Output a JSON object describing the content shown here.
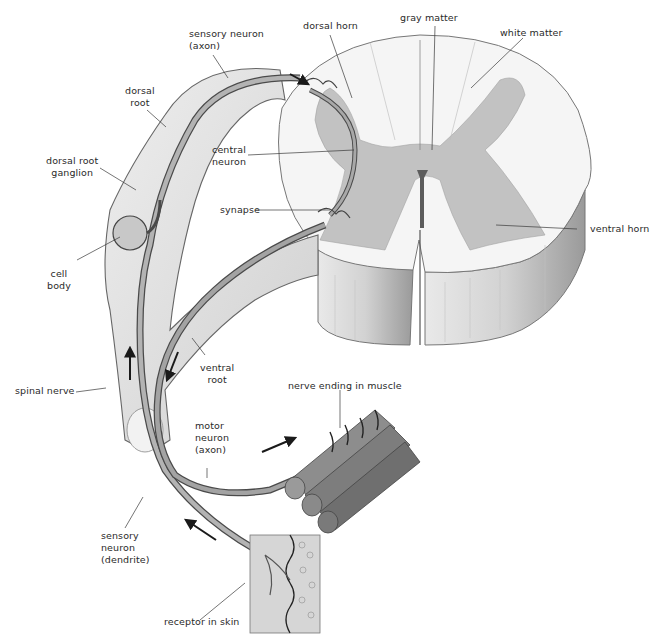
{
  "diagram": {
    "colors": {
      "nerve": "#a9a9a9",
      "nerve_dark": "#5a5a5a",
      "gray_matter": "#b7b7b7",
      "white_matter": "#f3f3f3",
      "outline": "#6a6a6a",
      "text": "#2a2a2a"
    },
    "labels": {
      "sensory_axon": [
        "sensory neuron",
        "(axon)"
      ],
      "dorsal_horn": "dorsal horn",
      "gray_matter": "gray matter",
      "white_matter": "white matter",
      "dorsal_root": [
        "dorsal",
        "root"
      ],
      "dorsal_root_ganglion": [
        "dorsal root",
        "ganglion"
      ],
      "central_neuron": [
        "central",
        "neuron"
      ],
      "synapse": "synapse",
      "cell_body": [
        "cell",
        "body"
      ],
      "ventral_horn": "ventral horn",
      "spinal_nerve": "spinal nerve",
      "ventral_root": [
        "ventral",
        "root"
      ],
      "nerve_ending_muscle": "nerve ending in muscle",
      "motor_axon": [
        "motor",
        "neuron",
        "(axon)"
      ],
      "sensory_dendrite": [
        "sensory",
        "neuron",
        "(dendrite)"
      ],
      "receptor_skin": "receptor in skin"
    },
    "arrows": [
      {
        "name": "sensory-upward-arrow",
        "direction": "up"
      },
      {
        "name": "motor-downward-arrow",
        "direction": "down"
      },
      {
        "name": "motor-outward-arrow",
        "direction": "right"
      },
      {
        "name": "sensory-inward-arrow",
        "direction": "up-left"
      },
      {
        "name": "sensory-into-cord-arrow",
        "direction": "right"
      }
    ]
  }
}
